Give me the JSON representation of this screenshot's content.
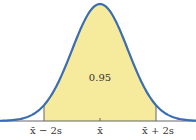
{
  "chart_data": {
    "type": "area",
    "title": "",
    "shaded_region": {
      "from": "x̄ − 2s",
      "to": "x̄ + 2s",
      "area": 0.95
    },
    "x_tick_labels": [
      "x̄ − 2s",
      "x̄",
      "x̄ + 2s"
    ],
    "area_label": "0.95",
    "xlabel": "",
    "ylabel": "",
    "grid": false
  },
  "labels": {
    "area": "0.95",
    "left": "x̄ − 2s",
    "center": "x̄",
    "right": "x̄ + 2s"
  },
  "colors": {
    "curve": "#3b6db3",
    "fill": "#f6ea9c",
    "axis": "#555555"
  }
}
